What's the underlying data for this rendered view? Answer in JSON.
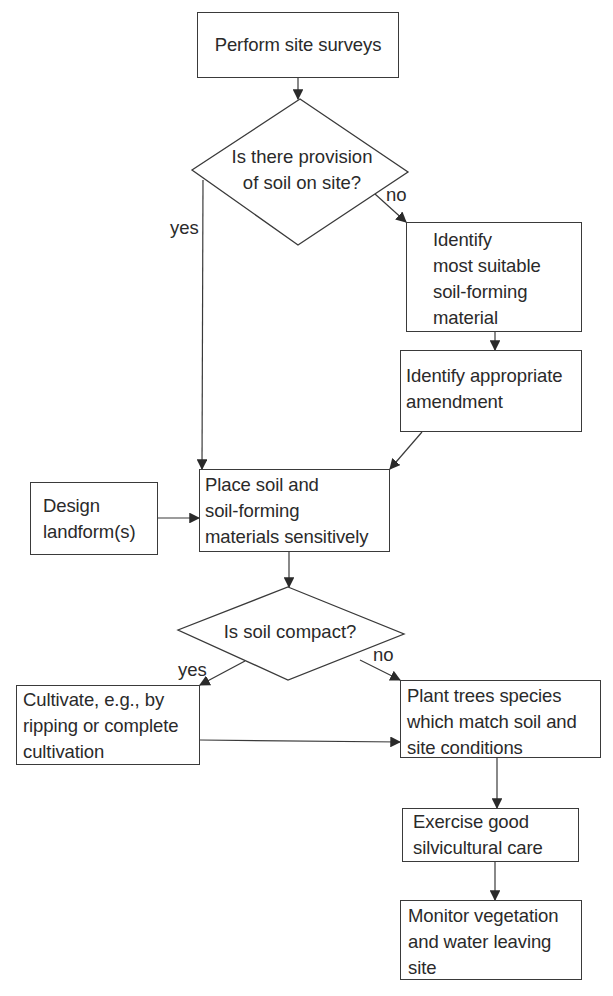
{
  "figure": {
    "type": "flowchart",
    "nodes": {
      "survey": {
        "kind": "process",
        "lines": [
          "Perform site surveys"
        ]
      },
      "soil_provision": {
        "kind": "decision",
        "lines": [
          "Is there provision",
          "of soil on site?"
        ]
      },
      "identify_material": {
        "kind": "process",
        "lines": [
          "Identify",
          "most suitable",
          "soil-forming",
          "material"
        ]
      },
      "identify_amendment": {
        "kind": "process",
        "lines": [
          "Identify appropriate",
          "amendment"
        ]
      },
      "place_soil": {
        "kind": "process",
        "lines": [
          "Place soil and",
          "soil-forming",
          "materials sensitively"
        ]
      },
      "design_landform": {
        "kind": "process",
        "lines": [
          "Design",
          "landform(s)"
        ]
      },
      "soil_compact": {
        "kind": "decision",
        "lines": [
          "Is soil compact?"
        ]
      },
      "cultivate": {
        "kind": "process",
        "lines": [
          "Cultivate, e.g., by",
          "ripping or complete",
          "cultivation"
        ]
      },
      "plant_trees": {
        "kind": "process",
        "lines": [
          "Plant trees species",
          "which match soil and",
          "site conditions"
        ]
      },
      "silvicultural_care": {
        "kind": "process",
        "lines": [
          "Exercise good",
          "silvicultural care"
        ]
      },
      "monitor": {
        "kind": "process",
        "lines": [
          "Monitor vegetation",
          "and water leaving",
          "site"
        ]
      }
    },
    "edges": [
      {
        "from": "survey",
        "to": "soil_provision",
        "label": ""
      },
      {
        "from": "soil_provision",
        "to": "place_soil",
        "label": "yes"
      },
      {
        "from": "soil_provision",
        "to": "identify_material",
        "label": "no"
      },
      {
        "from": "identify_material",
        "to": "identify_amendment",
        "label": ""
      },
      {
        "from": "identify_amendment",
        "to": "place_soil",
        "label": ""
      },
      {
        "from": "design_landform",
        "to": "place_soil",
        "label": ""
      },
      {
        "from": "place_soil",
        "to": "soil_compact",
        "label": ""
      },
      {
        "from": "soil_compact",
        "to": "cultivate",
        "label": "yes"
      },
      {
        "from": "soil_compact",
        "to": "plant_trees",
        "label": "no"
      },
      {
        "from": "cultivate",
        "to": "plant_trees",
        "label": ""
      },
      {
        "from": "plant_trees",
        "to": "silvicultural_care",
        "label": ""
      },
      {
        "from": "silvicultural_care",
        "to": "monitor",
        "label": ""
      }
    ],
    "edge_labels": {
      "provision_yes": "yes",
      "provision_no": "no",
      "compact_yes": "yes",
      "compact_no": "no"
    },
    "colors": {
      "line": "#3a3a3a",
      "text": "#2a2a2a",
      "background": "#ffffff"
    }
  }
}
